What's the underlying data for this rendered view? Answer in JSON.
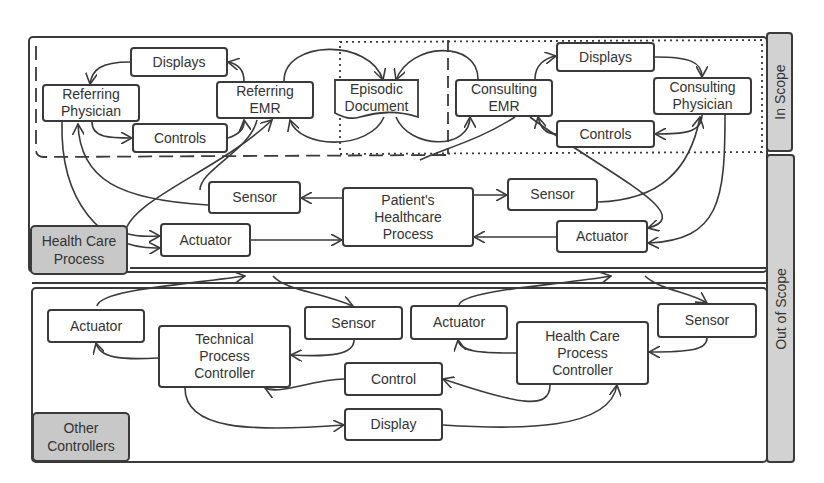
{
  "scopes": {
    "in_scope": "In Scope",
    "out_of_scope": "Out of Scope"
  },
  "groups": {
    "health_care_process": "Health Care\nProcess",
    "other_controllers": "Other\nControllers"
  },
  "in_scope": {
    "referring": {
      "physician": "Referring\nPhysician",
      "emr": "Referring\nEMR",
      "displays": "Displays",
      "controls": "Controls"
    },
    "episodic_document": "Episodic\nDocument",
    "consulting": {
      "emr": "Consulting\nEMR",
      "physician": "Consulting\nPhysician",
      "displays": "Displays",
      "controls": "Controls"
    }
  },
  "health_care_process": {
    "patient_process": "Patient's\nHealthcare\nProcess",
    "sensor_left": "Sensor",
    "sensor_right": "Sensor",
    "actuator_left": "Actuator",
    "actuator_right": "Actuator"
  },
  "other_controllers": {
    "technical_controller": "Technical\nProcess\nController",
    "healthcare_controller": "Health Care\nProcess\nController",
    "actuator_left": "Actuator",
    "sensor_left": "Sensor",
    "actuator_right": "Actuator",
    "sensor_right": "Sensor",
    "control": "Control",
    "display": "Display"
  },
  "colors": {
    "line": "#3a3a3a",
    "tag_fill": "#c8c8c8",
    "sidebar_fill": "#d2d2d2",
    "background": "#ffffff"
  }
}
